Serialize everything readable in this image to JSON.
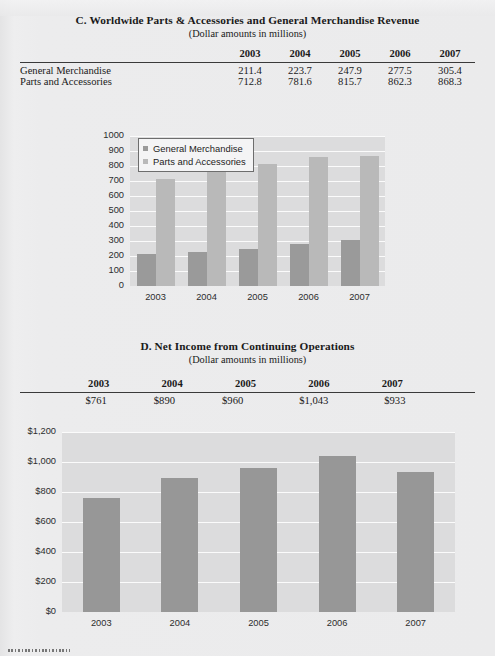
{
  "sections": {
    "c": {
      "title": "C. Worldwide Parts & Accessories and General Merchandise Revenue",
      "subtitle": "(Dollar amounts in millions)",
      "years": [
        "2003",
        "2004",
        "2005",
        "2006",
        "2007"
      ],
      "rows": [
        {
          "label": "General Merchandise",
          "values": [
            "211.4",
            "223.7",
            "247.9",
            "277.5",
            "305.4"
          ]
        },
        {
          "label": "Parts and Accessories",
          "values": [
            "712.8",
            "781.6",
            "815.7",
            "862.3",
            "868.3"
          ]
        }
      ]
    },
    "d": {
      "title": "D. Net Income from Continuing Operations",
      "subtitle": "(Dollar amounts in millions)",
      "years": [
        "2003",
        "2004",
        "2005",
        "2006",
        "2007"
      ],
      "values": [
        "$761",
        "$890",
        "$960",
        "$1,043",
        "$933"
      ]
    }
  },
  "chart_data": [
    {
      "type": "bar",
      "title": "",
      "xlabel": "",
      "ylabel": "",
      "categories": [
        "2003",
        "2004",
        "2005",
        "2006",
        "2007"
      ],
      "series": [
        {
          "name": "General Merchandise",
          "values": [
            211.4,
            223.7,
            247.9,
            277.5,
            305.4
          ],
          "color": "#9a9a9a"
        },
        {
          "name": "Parts and Accessories",
          "values": [
            712.8,
            781.6,
            815.7,
            862.3,
            868.3
          ],
          "color": "#b9b9b9"
        }
      ],
      "yticks": [
        "1000",
        "900",
        "800",
        "700",
        "600",
        "500",
        "400",
        "300",
        "200",
        "100",
        "0"
      ],
      "ylim": [
        0,
        1000
      ],
      "grid": true,
      "legend_position": "top-left",
      "plot_background": "#dcdcdd",
      "gridline_color": "#fbfbfb"
    },
    {
      "type": "bar",
      "title": "",
      "xlabel": "",
      "ylabel": "",
      "categories": [
        "2003",
        "2004",
        "2005",
        "2006",
        "2007"
      ],
      "values": [
        761,
        890,
        960,
        1043,
        933
      ],
      "yticks": [
        "$1,200",
        "$1,000",
        "$800",
        "$600",
        "$400",
        "$200",
        "$0"
      ],
      "ylim": [
        0,
        1200
      ],
      "grid": true,
      "bar_color": "#979797",
      "plot_background": "#dcdcdd",
      "gridline_color": "#fbfbfb"
    }
  ]
}
